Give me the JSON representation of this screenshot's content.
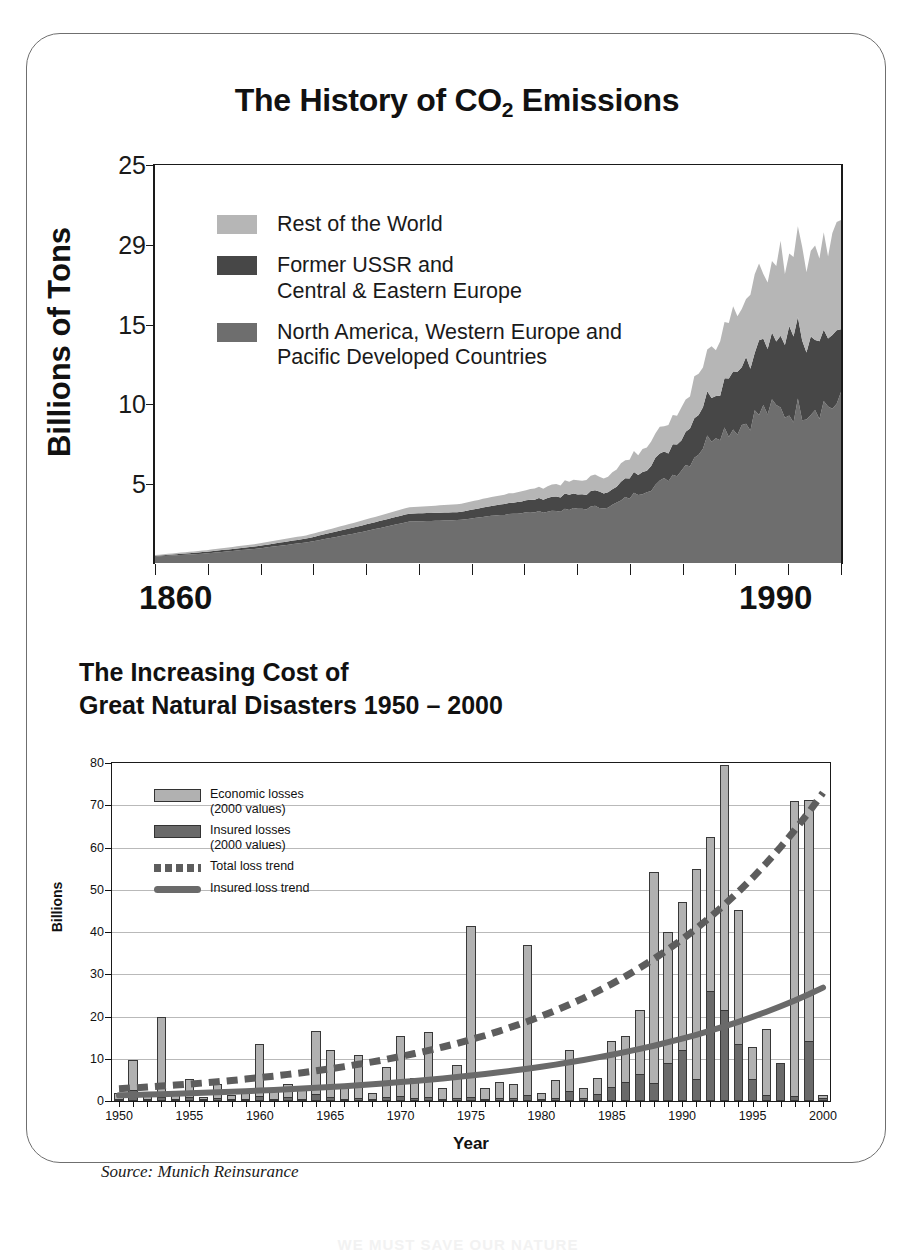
{
  "chart_data": [
    {
      "type": "area",
      "title": "The History of CO2 Emissions",
      "title_main": "The History of CO",
      "title_sub": "2",
      "title_tail": " Emissions",
      "xlabel": "",
      "ylabel": "Billions of Tons",
      "x_first_label": "1860",
      "x_last_label": "1990",
      "xlim": [
        1860,
        1995
      ],
      "ylim": [
        0,
        25
      ],
      "ytick_labels": [
        "25",
        "29",
        "15",
        "10",
        "5"
      ],
      "ytick_values": [
        25,
        20,
        15,
        10,
        5
      ],
      "grid": false,
      "legend_position": "inside-top-left",
      "stacked": true,
      "x": [
        1860,
        1870,
        1880,
        1890,
        1900,
        1910,
        1920,
        1930,
        1940,
        1950,
        1955,
        1960,
        1965,
        1970,
        1975,
        1980,
        1985,
        1990,
        1995
      ],
      "series": [
        {
          "name": "North America, Western Europe and Pacific Developed Countries",
          "color": "#6e6e6e",
          "values": [
            0.4,
            0.6,
            0.9,
            1.3,
            1.9,
            2.6,
            2.7,
            3.1,
            3.3,
            3.6,
            4.4,
            5.1,
            6.3,
            8.2,
            8.6,
            9.6,
            9.5,
            10.0,
            9.9
          ]
        },
        {
          "name": "Former USSR and Central & Eastern Europe",
          "color": "#474747",
          "values": [
            0.05,
            0.1,
            0.15,
            0.25,
            0.4,
            0.5,
            0.5,
            0.7,
            0.9,
            1.0,
            1.3,
            1.7,
            2.2,
            2.9,
            3.6,
            4.4,
            4.9,
            5.0,
            4.4
          ]
        },
        {
          "name": "Rest of the World",
          "color": "#b6b6b6",
          "values": [
            0.05,
            0.1,
            0.15,
            0.2,
            0.3,
            0.4,
            0.5,
            0.6,
            0.8,
            1.0,
            1.3,
            1.7,
            2.2,
            3.0,
            4.0,
            4.8,
            5.4,
            6.0,
            6.4
          ]
        }
      ],
      "legend": [
        {
          "label": "Rest of the World",
          "color": "#b6b6b6"
        },
        {
          "label": "Former USSR and\nCentral & Eastern Europe",
          "color": "#474747"
        },
        {
          "label": "North America, Western Europe and\nPacific Developed Countries",
          "color": "#6e6e6e"
        }
      ]
    },
    {
      "type": "bar",
      "title_line1": "The Increasing Cost of",
      "title_line2": "Great Natural Disasters 1950 – 2000",
      "xlabel": "Year",
      "ylabel": "Billions",
      "source": "Source: Munich Reinsurance",
      "ylim": [
        0,
        80
      ],
      "ytick_labels": [
        "0",
        "10",
        "20",
        "30",
        "40",
        "50",
        "60",
        "70",
        "80"
      ],
      "xtick_labels": [
        "1950",
        "1955",
        "1960",
        "1965",
        "1970",
        "1975",
        "1980",
        "1985",
        "1990",
        "1995",
        "2000"
      ],
      "grid": true,
      "legend_position": "inside-top-left",
      "categories": [
        1950,
        1951,
        1952,
        1953,
        1954,
        1955,
        1956,
        1957,
        1958,
        1959,
        1960,
        1961,
        1962,
        1963,
        1964,
        1965,
        1966,
        1967,
        1968,
        1969,
        1970,
        1971,
        1972,
        1973,
        1974,
        1975,
        1976,
        1977,
        1978,
        1979,
        1980,
        1981,
        1982,
        1983,
        1984,
        1985,
        1986,
        1987,
        1988,
        1989,
        1990,
        1991,
        1992,
        1993,
        1994,
        1995,
        1996,
        1997,
        1998,
        1999,
        2000
      ],
      "series": [
        {
          "name": "Economic losses (2000 values)",
          "color": "#b1b1b1",
          "values": [
            2.0,
            9.6,
            1.5,
            20.0,
            2.0,
            5.2,
            1.0,
            4.0,
            1.5,
            2.0,
            13.5,
            2.5,
            4.0,
            3.5,
            16.5,
            12.0,
            3.0,
            11.0,
            2.0,
            8.0,
            15.3,
            5.5,
            16.3,
            3.0,
            8.5,
            41.5,
            3.0,
            4.5,
            4.0,
            37.0,
            2.0,
            5.0,
            12.0,
            3.0,
            5.5,
            14.3,
            15.3,
            21.5,
            54.3,
            40.0,
            47.0,
            55.0,
            62.5,
            79.5,
            45.3,
            12.7,
            17.0,
            8.5,
            71.0,
            71.2,
            1.5
          ]
        },
        {
          "name": "Insured losses (2000 values)",
          "color": "#6a6a6a",
          "values": [
            0.3,
            2.7,
            0.3,
            1.0,
            0.5,
            1.0,
            0.3,
            0.6,
            0.3,
            0.4,
            1.2,
            0.4,
            1.0,
            0.4,
            1.6,
            0.9,
            0.4,
            0.8,
            0.3,
            0.9,
            1.1,
            0.6,
            1.0,
            0.3,
            0.8,
            1.0,
            0.5,
            0.6,
            0.6,
            1.4,
            0.4,
            0.8,
            2.4,
            0.6,
            1.6,
            3.2,
            4.6,
            6.5,
            4.3,
            9.0,
            12.0,
            5.2,
            26.0,
            21.5,
            13.5,
            5.2,
            1.5,
            9.0,
            1.2,
            14.3,
            0.7
          ]
        }
      ],
      "trend_total": {
        "name": "Total loss trend",
        "color": "#5d5d5d",
        "style": "dashed"
      },
      "trend_insured": {
        "name": "Insured loss trend",
        "color": "#6a6a6a",
        "style": "solid"
      },
      "legend": [
        {
          "label": "Economic losses\n(2000 values)",
          "color": "#b1b1b1",
          "kind": "swatch"
        },
        {
          "label": "Insured losses\n(2000 values)",
          "color": "#6a6a6a",
          "kind": "swatch"
        },
        {
          "label": "Total loss trend",
          "color": "#5d5d5d",
          "kind": "dashed-line"
        },
        {
          "label": "Insured loss trend",
          "color": "#6a6a6a",
          "kind": "solid-line"
        }
      ]
    }
  ],
  "page": {
    "bottom_caption": "WE MUST SAVE OUR NATURE"
  }
}
